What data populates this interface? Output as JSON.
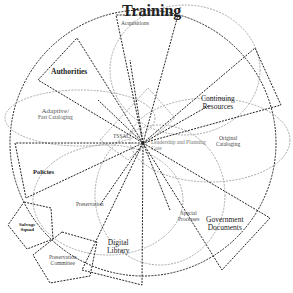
{
  "diagram": {
    "center": {
      "x": 143,
      "y": 143
    },
    "labels": {
      "training": "Training",
      "acquisitions": "Acquisitions",
      "authorities": "Authorities",
      "adaptive_line1": "Adaptive/",
      "adaptive_line2": "Fast Cataloging",
      "continuing_line1": "Continuing",
      "continuing_line2": "Resources",
      "tssac": "TSSAC",
      "leadership_line1": "Leadership and Planning",
      "leadership_line2": "Core",
      "original_line1": "Original",
      "original_line2": "Cataloging",
      "policies": "Policies",
      "preservation": "Preservation",
      "salvage_line1": "Salvage",
      "salvage_line2": "Squad",
      "special_line1": "Special",
      "special_line2": "Processes",
      "government_line1": "Government",
      "government_line2": "Documents",
      "digital_line1": "Digital",
      "digital_line2": "Library",
      "presc_line1": "Preservation",
      "presc_line2": "Committee"
    }
  }
}
